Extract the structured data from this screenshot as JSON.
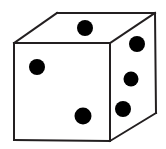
{
  "figure": {
    "background_color": "#ffffff",
    "stroke_color": "#231f20",
    "pip_color": "#000000",
    "stroke_width": 2,
    "width": 166,
    "height": 149
  },
  "chart_data": {
    "type": "diagram",
    "object": "die",
    "visible_faces": [
      {
        "name": "top-face",
        "pip_count": 1
      },
      {
        "name": "front-face",
        "pip_count": 2
      },
      {
        "name": "right-face",
        "pip_count": 3
      }
    ],
    "total_visible_pips": 6,
    "vertices": {
      "front_top_left": [
        14,
        43
      ],
      "front_top_right": [
        110,
        43
      ],
      "front_bottom_left": [
        14,
        140
      ],
      "front_bottom_right": [
        110,
        141
      ],
      "back_top_left": [
        57,
        13
      ],
      "back_top_right": [
        155,
        13
      ],
      "right_bottom_back": [
        156,
        113
      ]
    },
    "edges": [
      {
        "name": "front-top",
        "from": [
          14,
          43
        ],
        "to": [
          110,
          43
        ]
      },
      {
        "name": "front-left",
        "from": [
          14,
          43
        ],
        "to": [
          14,
          140
        ]
      },
      {
        "name": "front-bottom",
        "from": [
          14,
          140
        ],
        "to": [
          110,
          141
        ]
      },
      {
        "name": "front-right",
        "from": [
          110,
          43
        ],
        "to": [
          110,
          141
        ]
      },
      {
        "name": "top-left-back",
        "from": [
          14,
          43
        ],
        "to": [
          57,
          13
        ]
      },
      {
        "name": "top-back",
        "from": [
          57,
          13
        ],
        "to": [
          155,
          13
        ]
      },
      {
        "name": "top-right-back",
        "from": [
          110,
          43
        ],
        "to": [
          155,
          13
        ]
      },
      {
        "name": "right-back-vertical",
        "from": [
          155,
          13
        ],
        "to": [
          156,
          113
        ]
      },
      {
        "name": "right-bottom",
        "from": [
          110,
          141
        ],
        "to": [
          156,
          113
        ]
      }
    ],
    "pips": [
      {
        "face": "top-face",
        "name": "pip-top-1",
        "cx": 85,
        "cy": 28,
        "r": 8
      },
      {
        "face": "front-face",
        "name": "pip-front-1",
        "cx": 37,
        "cy": 67,
        "r": 8
      },
      {
        "face": "front-face",
        "name": "pip-front-2",
        "cx": 83,
        "cy": 116,
        "r": 8.5
      },
      {
        "face": "right-face",
        "name": "pip-right-1",
        "cx": 137,
        "cy": 44,
        "r": 8
      },
      {
        "face": "right-face",
        "name": "pip-right-2",
        "cx": 131,
        "cy": 79,
        "r": 7.5
      },
      {
        "face": "right-face",
        "name": "pip-right-3",
        "cx": 123,
        "cy": 109,
        "r": 8
      }
    ]
  }
}
